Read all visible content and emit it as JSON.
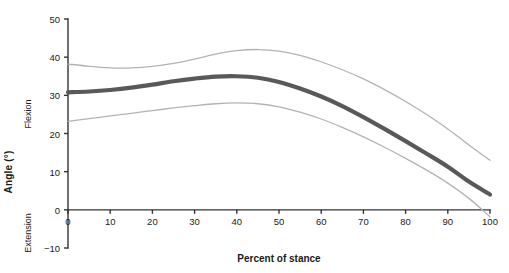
{
  "chart_data": {
    "type": "line",
    "title": "",
    "xlabel": "Percent of stance",
    "ylabel": "Angle (°)",
    "ylabel_upper": "Flexion",
    "ylabel_lower": "Extension",
    "xlim": [
      0,
      100
    ],
    "ylim": [
      -10,
      50
    ],
    "xticks": [
      0,
      10,
      20,
      30,
      40,
      50,
      60,
      70,
      80,
      90,
      100
    ],
    "yticks": [
      -10,
      0,
      10,
      20,
      30,
      40,
      50
    ],
    "xtick_labels": [
      "0",
      "10",
      "20",
      "30",
      "40",
      "50",
      "60",
      "70",
      "80",
      "90",
      "100"
    ],
    "ytick_labels": [
      "-10",
      "0",
      "10",
      "20",
      "30",
      "40",
      "50"
    ],
    "grid": false,
    "legend": "none",
    "x": [
      0,
      5,
      10,
      15,
      20,
      25,
      30,
      35,
      40,
      45,
      50,
      55,
      60,
      65,
      70,
      75,
      80,
      85,
      90,
      95,
      100
    ],
    "series": [
      {
        "name": "mean",
        "role": "mean-curve",
        "color": "#595959",
        "width": 4.2,
        "values": [
          30.8,
          31.0,
          31.4,
          32.0,
          32.8,
          33.7,
          34.4,
          34.9,
          35.0,
          34.6,
          33.5,
          31.8,
          29.7,
          27.2,
          24.3,
          21.2,
          18.0,
          14.7,
          11.3,
          7.4,
          4.0
        ]
      },
      {
        "name": "upper bound",
        "role": "upper-band",
        "color": "#b3b3b3",
        "width": 1.3,
        "values": [
          38.2,
          37.6,
          37.2,
          37.2,
          37.6,
          38.4,
          39.5,
          40.8,
          41.7,
          42.0,
          41.6,
          40.5,
          38.8,
          36.7,
          34.3,
          31.5,
          28.4,
          25.0,
          21.2,
          17.0,
          13.0
        ]
      },
      {
        "name": "lower bound",
        "role": "lower-band",
        "color": "#b3b3b3",
        "width": 1.3,
        "values": [
          23.2,
          23.9,
          24.6,
          25.3,
          26.0,
          26.7,
          27.3,
          27.8,
          28.0,
          27.8,
          27.0,
          25.6,
          23.8,
          21.6,
          19.1,
          16.4,
          13.5,
          10.4,
          7.0,
          3.0,
          -1.8
        ]
      }
    ],
    "axis": {
      "color": "#333333",
      "line_width": 1.4
    },
    "plot_box": {
      "left": 68,
      "right": 490,
      "top_value": 50,
      "bottom_value": -10,
      "y_top_px": 19,
      "y_zero_px": 210,
      "y_bottom_px": 248
    }
  }
}
